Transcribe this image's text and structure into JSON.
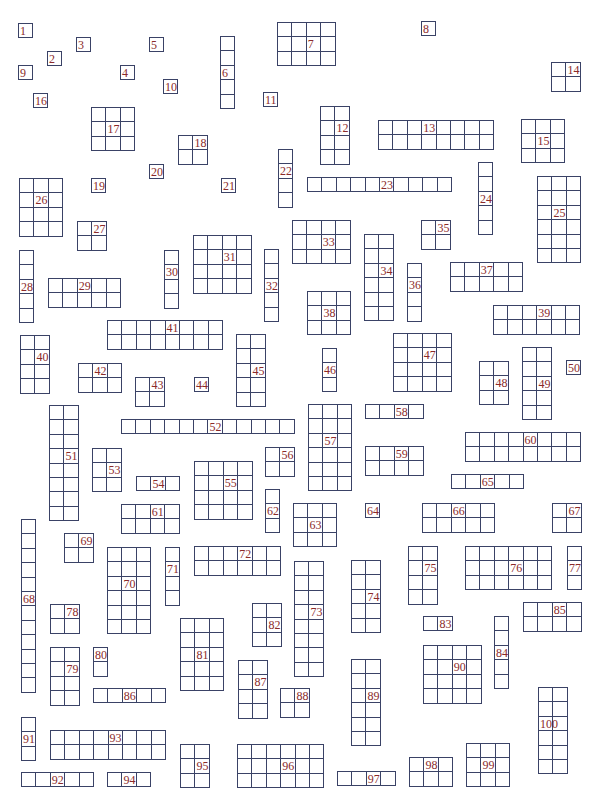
{
  "puzzle": {
    "cell_size": 14.4,
    "line_color": "#3a4266",
    "label_color": "#8b2a2a",
    "boxes": [
      {
        "n": "1",
        "x": 18,
        "y": 23,
        "c": 1,
        "r": 1,
        "lx": 0,
        "ly": 0
      },
      {
        "n": "2",
        "x": 47,
        "y": 51,
        "c": 1,
        "r": 1,
        "lx": 0,
        "ly": 0
      },
      {
        "n": "3",
        "x": 76,
        "y": 37,
        "c": 1,
        "r": 1,
        "lx": 0,
        "ly": 0
      },
      {
        "n": "4",
        "x": 120,
        "y": 65,
        "c": 1,
        "r": 1,
        "lx": 0,
        "ly": 0
      },
      {
        "n": "5",
        "x": 149,
        "y": 37,
        "c": 1,
        "r": 1,
        "lx": 0,
        "ly": 0
      },
      {
        "n": "6",
        "x": 220,
        "y": 36,
        "c": 1,
        "r": 5,
        "lx": 0,
        "ly": 2
      },
      {
        "n": "7",
        "x": 277,
        "y": 22,
        "c": 4,
        "r": 3,
        "lx": 2,
        "ly": 1
      },
      {
        "n": "8",
        "x": 421,
        "y": 21,
        "c": 1,
        "r": 1,
        "lx": 0,
        "ly": 0
      },
      {
        "n": "9",
        "x": 18,
        "y": 65,
        "c": 1,
        "r": 1,
        "lx": 0,
        "ly": 0
      },
      {
        "n": "10",
        "x": 163,
        "y": 79,
        "c": 1,
        "r": 1,
        "lx": 0,
        "ly": 0
      },
      {
        "n": "11",
        "x": 263,
        "y": 92,
        "c": 1,
        "r": 1,
        "lx": 0,
        "ly": 0
      },
      {
        "n": "12",
        "x": 320,
        "y": 106,
        "c": 2,
        "r": 4,
        "lx": 1,
        "ly": 1
      },
      {
        "n": "13",
        "x": 378,
        "y": 120,
        "c": 8,
        "r": 2,
        "lx": 3,
        "ly": 0
      },
      {
        "n": "14",
        "x": 551,
        "y": 62,
        "c": 2,
        "r": 2,
        "lx": 1,
        "ly": 0
      },
      {
        "n": "15",
        "x": 521,
        "y": 119,
        "c": 3,
        "r": 3,
        "lx": 1,
        "ly": 1
      },
      {
        "n": "16",
        "x": 33,
        "y": 93,
        "c": 1,
        "r": 1,
        "lx": 0,
        "ly": 0
      },
      {
        "n": "17",
        "x": 91,
        "y": 107,
        "c": 3,
        "r": 3,
        "lx": 1,
        "ly": 1
      },
      {
        "n": "18",
        "x": 178,
        "y": 135,
        "c": 2,
        "r": 2,
        "lx": 1,
        "ly": 0
      },
      {
        "n": "19",
        "x": 91,
        "y": 178,
        "c": 1,
        "r": 1,
        "lx": 0,
        "ly": 0
      },
      {
        "n": "20",
        "x": 149,
        "y": 164,
        "c": 1,
        "r": 1,
        "lx": 0,
        "ly": 0
      },
      {
        "n": "21",
        "x": 221,
        "y": 178,
        "c": 1,
        "r": 1,
        "lx": 0,
        "ly": 0
      },
      {
        "n": "22",
        "x": 278,
        "y": 149,
        "c": 1,
        "r": 4,
        "lx": 0,
        "ly": 1
      },
      {
        "n": "23",
        "x": 307,
        "y": 177,
        "c": 10,
        "r": 1,
        "lx": 5,
        "ly": 0
      },
      {
        "n": "24",
        "x": 478,
        "y": 162,
        "c": 1,
        "r": 5,
        "lx": 0,
        "ly": 2
      },
      {
        "n": "25",
        "x": 537,
        "y": 176,
        "c": 3,
        "r": 6,
        "lx": 1,
        "ly": 2
      },
      {
        "n": "26",
        "x": 19,
        "y": 178,
        "c": 3,
        "r": 4,
        "lx": 1,
        "ly": 1
      },
      {
        "n": "27",
        "x": 77,
        "y": 221,
        "c": 2,
        "r": 2,
        "lx": 1,
        "ly": 0
      },
      {
        "n": "28",
        "x": 19,
        "y": 250,
        "c": 1,
        "r": 5,
        "lx": 0,
        "ly": 2
      },
      {
        "n": "29",
        "x": 48,
        "y": 278,
        "c": 5,
        "r": 2,
        "lx": 2,
        "ly": 0
      },
      {
        "n": "30",
        "x": 164,
        "y": 250,
        "c": 1,
        "r": 4,
        "lx": 0,
        "ly": 1
      },
      {
        "n": "31",
        "x": 193,
        "y": 235,
        "c": 4,
        "r": 4,
        "lx": 2,
        "ly": 1
      },
      {
        "n": "32",
        "x": 264,
        "y": 249,
        "c": 1,
        "r": 5,
        "lx": 0,
        "ly": 2
      },
      {
        "n": "33",
        "x": 292,
        "y": 220,
        "c": 4,
        "r": 3,
        "lx": 2,
        "ly": 1
      },
      {
        "n": "34",
        "x": 364,
        "y": 234,
        "c": 2,
        "r": 6,
        "lx": 1,
        "ly": 2
      },
      {
        "n": "35",
        "x": 421,
        "y": 220,
        "c": 2,
        "r": 2,
        "lx": 1,
        "ly": 0
      },
      {
        "n": "36",
        "x": 407,
        "y": 263,
        "c": 1,
        "r": 4,
        "lx": 0,
        "ly": 1
      },
      {
        "n": "37",
        "x": 450,
        "y": 262,
        "c": 5,
        "r": 2,
        "lx": 2,
        "ly": 0
      },
      {
        "n": "38",
        "x": 307,
        "y": 291,
        "c": 3,
        "r": 3,
        "lx": 1,
        "ly": 1
      },
      {
        "n": "39",
        "x": 493,
        "y": 305,
        "c": 6,
        "r": 2,
        "lx": 3,
        "ly": 0
      },
      {
        "n": "40",
        "x": 20,
        "y": 335,
        "c": 2,
        "r": 4,
        "lx": 1,
        "ly": 1
      },
      {
        "n": "41",
        "x": 107,
        "y": 320,
        "c": 8,
        "r": 2,
        "lx": 4,
        "ly": 0
      },
      {
        "n": "42",
        "x": 78,
        "y": 363,
        "c": 3,
        "r": 2,
        "lx": 1,
        "ly": 0
      },
      {
        "n": "43",
        "x": 135,
        "y": 377,
        "c": 2,
        "r": 2,
        "lx": 1,
        "ly": 0
      },
      {
        "n": "44",
        "x": 194,
        "y": 377,
        "c": 1,
        "r": 1,
        "lx": 0,
        "ly": 0
      },
      {
        "n": "45",
        "x": 236,
        "y": 334,
        "c": 2,
        "r": 5,
        "lx": 1,
        "ly": 2
      },
      {
        "n": "46",
        "x": 322,
        "y": 348,
        "c": 1,
        "r": 3,
        "lx": 0,
        "ly": 1
      },
      {
        "n": "47",
        "x": 393,
        "y": 333,
        "c": 4,
        "r": 4,
        "lx": 2,
        "ly": 1
      },
      {
        "n": "48",
        "x": 479,
        "y": 361,
        "c": 2,
        "r": 3,
        "lx": 1,
        "ly": 1
      },
      {
        "n": "49",
        "x": 522,
        "y": 347,
        "c": 2,
        "r": 5,
        "lx": 1,
        "ly": 2
      },
      {
        "n": "50",
        "x": 566,
        "y": 360,
        "c": 1,
        "r": 1,
        "lx": 0,
        "ly": 0
      },
      {
        "n": "51",
        "x": 49,
        "y": 405,
        "c": 2,
        "r": 8,
        "lx": 1,
        "ly": 3
      },
      {
        "n": "52",
        "x": 121,
        "y": 419,
        "c": 12,
        "r": 1,
        "lx": 6,
        "ly": 0
      },
      {
        "n": "53",
        "x": 92,
        "y": 448,
        "c": 2,
        "r": 3,
        "lx": 1,
        "ly": 1
      },
      {
        "n": "54",
        "x": 136,
        "y": 476,
        "c": 3,
        "r": 1,
        "lx": 1,
        "ly": 0
      },
      {
        "n": "55",
        "x": 194,
        "y": 461,
        "c": 4,
        "r": 4,
        "lx": 2,
        "ly": 1
      },
      {
        "n": "56",
        "x": 265,
        "y": 447,
        "c": 2,
        "r": 2,
        "lx": 1,
        "ly": 0
      },
      {
        "n": "57",
        "x": 308,
        "y": 404,
        "c": 3,
        "r": 6,
        "lx": 1,
        "ly": 2
      },
      {
        "n": "58",
        "x": 365,
        "y": 404,
        "c": 4,
        "r": 1,
        "lx": 2,
        "ly": 0
      },
      {
        "n": "59",
        "x": 365,
        "y": 446,
        "c": 4,
        "r": 2,
        "lx": 2,
        "ly": 0
      },
      {
        "n": "60",
        "x": 465,
        "y": 432,
        "c": 8,
        "r": 2,
        "lx": 4,
        "ly": 0
      },
      {
        "n": "61",
        "x": 121,
        "y": 504,
        "c": 4,
        "r": 2,
        "lx": 2,
        "ly": 0
      },
      {
        "n": "62",
        "x": 265,
        "y": 489,
        "c": 1,
        "r": 3,
        "lx": 0,
        "ly": 1
      },
      {
        "n": "63",
        "x": 293,
        "y": 503,
        "c": 3,
        "r": 3,
        "lx": 1,
        "ly": 1
      },
      {
        "n": "64",
        "x": 365,
        "y": 503,
        "c": 1,
        "r": 1,
        "lx": 0,
        "ly": 0
      },
      {
        "n": "65",
        "x": 451,
        "y": 474,
        "c": 5,
        "r": 1,
        "lx": 2,
        "ly": 0
      },
      {
        "n": "66",
        "x": 422,
        "y": 503,
        "c": 5,
        "r": 2,
        "lx": 2,
        "ly": 0
      },
      {
        "n": "67",
        "x": 552,
        "y": 503,
        "c": 2,
        "r": 2,
        "lx": 1,
        "ly": 0
      },
      {
        "n": "68",
        "x": 21,
        "y": 519,
        "c": 1,
        "r": 12,
        "lx": 0,
        "ly": 5
      },
      {
        "n": "69",
        "x": 64,
        "y": 533,
        "c": 2,
        "r": 2,
        "lx": 1,
        "ly": 0
      },
      {
        "n": "70",
        "x": 107,
        "y": 547,
        "c": 3,
        "r": 6,
        "lx": 1,
        "ly": 2
      },
      {
        "n": "71",
        "x": 165,
        "y": 547,
        "c": 1,
        "r": 4,
        "lx": 0,
        "ly": 1
      },
      {
        "n": "72",
        "x": 194,
        "y": 546,
        "c": 6,
        "r": 2,
        "lx": 3,
        "ly": 0
      },
      {
        "n": "73",
        "x": 294,
        "y": 561,
        "c": 2,
        "r": 8,
        "lx": 1,
        "ly": 3
      },
      {
        "n": "74",
        "x": 351,
        "y": 560,
        "c": 2,
        "r": 5,
        "lx": 1,
        "ly": 2
      },
      {
        "n": "75",
        "x": 408,
        "y": 546,
        "c": 2,
        "r": 4,
        "lx": 1,
        "ly": 1
      },
      {
        "n": "76",
        "x": 465,
        "y": 546,
        "c": 6,
        "r": 3,
        "lx": 3,
        "ly": 1
      },
      {
        "n": "77",
        "x": 567,
        "y": 546,
        "c": 1,
        "r": 3,
        "lx": 0,
        "ly": 1
      },
      {
        "n": "78",
        "x": 50,
        "y": 604,
        "c": 2,
        "r": 2,
        "lx": 1,
        "ly": 0
      },
      {
        "n": "79",
        "x": 50,
        "y": 647,
        "c": 2,
        "r": 4,
        "lx": 1,
        "ly": 1
      },
      {
        "n": "80",
        "x": 93,
        "y": 647,
        "c": 1,
        "r": 2,
        "lx": 0,
        "ly": 0
      },
      {
        "n": "81",
        "x": 180,
        "y": 618,
        "c": 3,
        "r": 5,
        "lx": 1,
        "ly": 2
      },
      {
        "n": "82",
        "x": 252,
        "y": 603,
        "c": 2,
        "r": 3,
        "lx": 1,
        "ly": 1
      },
      {
        "n": "83",
        "x": 423,
        "y": 616,
        "c": 2,
        "r": 1,
        "lx": 1,
        "ly": 0
      },
      {
        "n": "84",
        "x": 494,
        "y": 616,
        "c": 1,
        "r": 5,
        "lx": 0,
        "ly": 2
      },
      {
        "n": "85",
        "x": 523,
        "y": 602,
        "c": 4,
        "r": 2,
        "lx": 2,
        "ly": 0
      },
      {
        "n": "86",
        "x": 93,
        "y": 688,
        "c": 5,
        "r": 1,
        "lx": 2,
        "ly": 0
      },
      {
        "n": "87",
        "x": 238,
        "y": 660,
        "c": 2,
        "r": 4,
        "lx": 1,
        "ly": 1
      },
      {
        "n": "88",
        "x": 280,
        "y": 688,
        "c": 2,
        "r": 2,
        "lx": 1,
        "ly": 0
      },
      {
        "n": "89",
        "x": 351,
        "y": 659,
        "c": 2,
        "r": 6,
        "lx": 1,
        "ly": 2
      },
      {
        "n": "90",
        "x": 423,
        "y": 645,
        "c": 4,
        "r": 4,
        "lx": 2,
        "ly": 1
      },
      {
        "n": "91",
        "x": 21,
        "y": 717,
        "c": 1,
        "r": 3,
        "lx": 0,
        "ly": 1
      },
      {
        "n": "92",
        "x": 21,
        "y": 772,
        "c": 5,
        "r": 1,
        "lx": 2,
        "ly": 0
      },
      {
        "n": "93",
        "x": 50,
        "y": 730,
        "c": 8,
        "r": 2,
        "lx": 4,
        "ly": 0
      },
      {
        "n": "94",
        "x": 107,
        "y": 772,
        "c": 3,
        "r": 1,
        "lx": 1,
        "ly": 0
      },
      {
        "n": "95",
        "x": 180,
        "y": 744,
        "c": 2,
        "r": 3,
        "lx": 1,
        "ly": 1
      },
      {
        "n": "96",
        "x": 237,
        "y": 744,
        "c": 6,
        "r": 3,
        "lx": 3,
        "ly": 1
      },
      {
        "n": "97",
        "x": 337,
        "y": 771,
        "c": 4,
        "r": 1,
        "lx": 2,
        "ly": 0
      },
      {
        "n": "98",
        "x": 409,
        "y": 757,
        "c": 3,
        "r": 2,
        "lx": 1,
        "ly": 0
      },
      {
        "n": "99",
        "x": 466,
        "y": 743,
        "c": 3,
        "r": 3,
        "lx": 1,
        "ly": 1
      },
      {
        "n": "100",
        "x": 538,
        "y": 687,
        "c": 2,
        "r": 6,
        "lx": 0,
        "ly": 2
      }
    ]
  }
}
